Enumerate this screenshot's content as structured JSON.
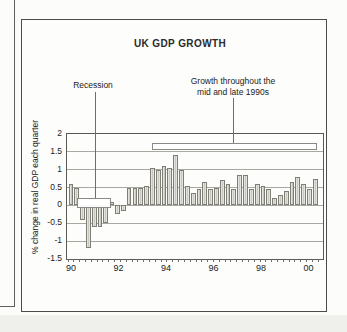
{
  "figure": {
    "title": "UK GDP GROWTH",
    "annotations": {
      "recession": {
        "label": "Recession"
      },
      "growth": {
        "line1": "Growth throughout the",
        "line2": "mid and late 1990s"
      }
    }
  },
  "chart_data": {
    "type": "bar",
    "title": "UK GDP GROWTH",
    "xlabel": "",
    "ylabel": "% change in real GDP each quarter",
    "ylim": [
      -1.5,
      2
    ],
    "grid": true,
    "ytick_labels": [
      "2",
      "1.5",
      "1",
      "0.5",
      "0",
      "-0.5",
      "-1",
      "-1.5"
    ],
    "ytick_values": [
      2,
      1.5,
      1,
      0.5,
      0,
      -0.5,
      -1,
      -1.5
    ],
    "xtick_labels": [
      "90",
      "92",
      "94",
      "96",
      "98",
      "00"
    ],
    "categories": [
      "90Q1",
      "90Q2",
      "90Q3",
      "90Q4",
      "91Q1",
      "91Q2",
      "91Q3",
      "91Q4",
      "92Q1",
      "92Q2",
      "92Q3",
      "92Q4",
      "93Q1",
      "93Q2",
      "93Q3",
      "93Q4",
      "94Q1",
      "94Q2",
      "94Q3",
      "94Q4",
      "95Q1",
      "95Q2",
      "95Q3",
      "95Q4",
      "96Q1",
      "96Q2",
      "96Q3",
      "96Q4",
      "97Q1",
      "97Q2",
      "97Q3",
      "97Q4",
      "98Q1",
      "98Q2",
      "98Q3",
      "98Q4",
      "99Q1",
      "99Q2",
      "99Q3",
      "99Q4",
      "00Q1",
      "00Q2",
      "00Q3"
    ],
    "values": [
      0.6,
      0.5,
      -0.4,
      -1.2,
      -0.6,
      -0.6,
      -0.5,
      0.1,
      -0.25,
      -0.15,
      0.5,
      0.5,
      0.5,
      0.55,
      1.05,
      1.0,
      1.1,
      1.05,
      1.4,
      1.0,
      0.55,
      0.35,
      0.45,
      0.65,
      0.45,
      0.5,
      0.7,
      0.6,
      0.45,
      0.85,
      0.85,
      0.45,
      0.6,
      0.55,
      0.45,
      0.2,
      0.3,
      0.4,
      0.65,
      0.8,
      0.6,
      0.45,
      0.75
    ],
    "annotations": [
      {
        "text": "Recession",
        "span": [
          "90Q3",
          "91Q4"
        ],
        "bracket_level": 0.15
      },
      {
        "text": "Growth throughout the mid and late 1990s",
        "span": [
          "93Q2",
          "00Q3"
        ],
        "bracket_level": 1.7
      }
    ],
    "bar_fill": "#d6d6cf",
    "bar_border": "#7e7e76",
    "grid_color": "#a8a8a0"
  }
}
